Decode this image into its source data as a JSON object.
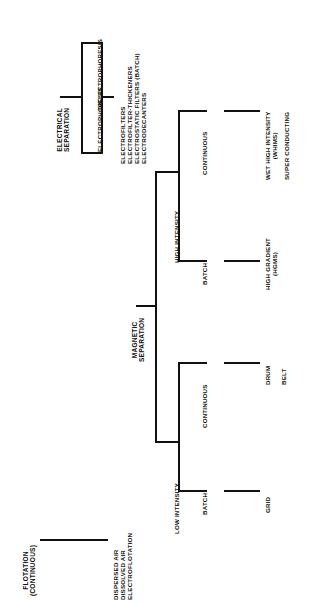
{
  "figure": {
    "type": "tree-diagram",
    "orientation": "rotated-90-ccw"
  },
  "electrical": {
    "root": {
      "line1": "ELECTRICAL",
      "line2": "SEPARATION"
    },
    "branches": [
      {
        "label": "ELECTROPHORESIS"
      },
      {
        "label": "DIELECTROPHORESIS"
      }
    ],
    "outputs": [
      "ELECTROFILTERS",
      "ELECTROFILTER-THICKENERS",
      "ELECTROSTATIC FILTERS (BATCH)",
      "ELECTRODECANTERS"
    ]
  },
  "magnetic": {
    "root": {
      "line1": "MAGNETIC",
      "line2": "SEPARATION"
    },
    "high": {
      "label": "HIGH INTENSITY",
      "modes": [
        {
          "label": "CONTINUOUS",
          "outputs": [
            {
              "line1": "WET HIGH INTENSITY",
              "line2": "(WHIMS)"
            },
            {
              "line1": "SUPER CONDUCTING",
              "line2": ""
            }
          ]
        },
        {
          "label": "BATCH",
          "outputs": [
            {
              "line1": "HIGH GRADIENT",
              "line2": "(HGMS)"
            }
          ]
        }
      ]
    },
    "low": {
      "label": "LOW INTENSITY",
      "modes": [
        {
          "label": "CONTINUOUS",
          "outputs": [
            {
              "line1": "DRUM",
              "line2": ""
            },
            {
              "line1": "BELT",
              "line2": ""
            }
          ]
        },
        {
          "label": "BATCH",
          "outputs": [
            {
              "line1": "GRID",
              "line2": ""
            }
          ]
        }
      ]
    }
  },
  "flotation": {
    "root": {
      "line1": "FLOTATION",
      "line2": "(CONTINUOUS)"
    },
    "outputs": [
      "DISPERSED AIR",
      "DISSOLVED AIR",
      "ELECTROFLOTATION"
    ]
  },
  "colors": {
    "ink": "#111111",
    "paper": "#ffffff"
  }
}
